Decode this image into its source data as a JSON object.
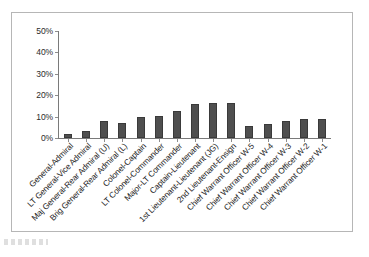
{
  "chart_data": {
    "type": "bar",
    "title": "",
    "subtitle": "",
    "xlabel": "",
    "ylabel": "",
    "ylim": [
      0,
      50
    ],
    "y_ticks": [
      0,
      10,
      20,
      30,
      40,
      50
    ],
    "y_tick_labels": [
      "0%",
      "10%",
      "20%",
      "30%",
      "40%",
      "50%"
    ],
    "grid": false,
    "legend": false,
    "legend_position": "none",
    "bar_color": "#4f4f4f",
    "axis_color": "#7a7a7a",
    "frame_color": "#b6b6b6",
    "categories": [
      "General-Admiral",
      "LT General-Vice Admiral",
      "Maj General-Rear Admiral (U)",
      "Brig General-Rear Admiral (L)",
      "Colonel-Captain",
      "LT Colonel-Commander",
      "Major-LT Commander",
      "Captain-Lieutenant",
      "1st Lieutenant-Lieutenant (JG)",
      "2nd Lieutenant-Ensign",
      "Chief Warrant Officer W-5",
      "Chief Warrant Officer W-4",
      "Chief Warrant Officer W-3",
      "Chief Warrant Officer W-2",
      "Chief Warrant Officer W-1"
    ],
    "values": [
      2,
      3.5,
      8,
      7,
      10,
      10.5,
      12.5,
      16,
      16.5,
      16.5,
      5.5,
      6.5,
      8,
      9,
      9
    ]
  }
}
